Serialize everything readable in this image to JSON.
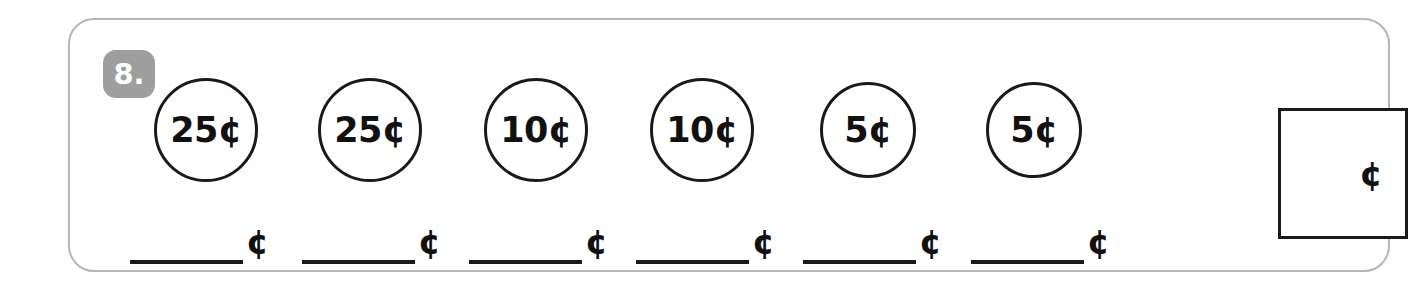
{
  "worksheet": {
    "problem_number": "8.",
    "coins": [
      {
        "label": "25¢",
        "value": 25,
        "size": "big"
      },
      {
        "label": "25¢",
        "value": 25,
        "size": "big"
      },
      {
        "label": "10¢",
        "value": 10,
        "size": "big"
      },
      {
        "label": "10¢",
        "value": 10,
        "size": "big"
      },
      {
        "label": "5¢",
        "value": 5,
        "size": "small"
      },
      {
        "label": "5¢",
        "value": 5,
        "size": "small"
      }
    ],
    "blanks": [
      {
        "value": "",
        "unit": "¢"
      },
      {
        "value": "",
        "unit": "¢"
      },
      {
        "value": "",
        "unit": "¢"
      },
      {
        "value": "",
        "unit": "¢"
      },
      {
        "value": "",
        "unit": "¢"
      },
      {
        "value": "",
        "unit": "¢"
      }
    ],
    "total_box": {
      "value": "",
      "unit": "¢"
    },
    "colors": {
      "badge_background": "#9e9e9e",
      "badge_text": "#ffffff",
      "card_border": "#b5b5b5",
      "ink": "#1a1a1a",
      "page_background": "#ffffff"
    }
  }
}
